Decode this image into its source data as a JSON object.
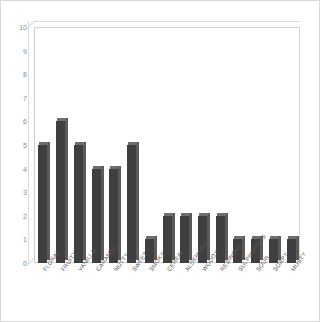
{
  "chart_data": {
    "type": "bar",
    "title": "",
    "xlabel": "",
    "ylabel": "",
    "ylim": [
      0,
      10
    ],
    "yticks": [
      0,
      1,
      2,
      3,
      4,
      5,
      6,
      7,
      8,
      9,
      10
    ],
    "grid": false,
    "legend": null,
    "categories": [
      "FLORAL",
      "FRUITY",
      "VANILLA",
      "CARAMEL",
      "NUTTY",
      "SWEET",
      "SMOKY",
      "CEREAL",
      "ALDEHYDIC",
      "WOODY",
      "RESINOUS",
      "SULPHUROUS",
      "SOUR",
      "SOAPY",
      "MUSTY"
    ],
    "values": [
      5,
      6,
      5,
      4,
      4,
      5,
      1,
      2,
      2,
      2,
      2,
      1,
      1,
      1,
      1
    ],
    "bar_color": "#3f3f3f",
    "bar_top_color": "#6e6e6e",
    "bar_side_color": "#5a5a5a",
    "axis_color": "#cfcfcf",
    "tick_label_color": "#888888",
    "category_label_color": "#5a5a5a",
    "background": "#ffffff"
  }
}
